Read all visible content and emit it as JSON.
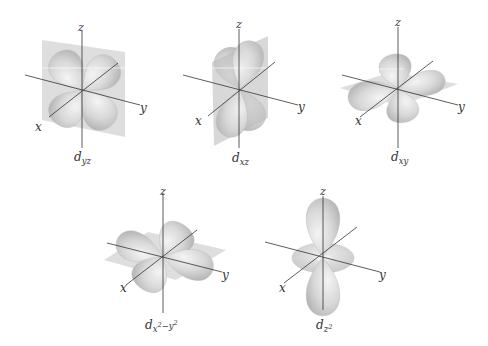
{
  "diagram": {
    "type": "d-orbital shapes",
    "colors": {
      "background": "#ffffff",
      "lobe_fill": "#d6d6d6",
      "lobe_highlight": "#f2f2f2",
      "lobe_shadow": "#b4b4b4",
      "plane_fill": "#bdbdbd",
      "axis_stroke": "#333333"
    },
    "axis_labels": {
      "x": "x",
      "y": "y",
      "z": "z"
    },
    "orbitals": [
      {
        "id": "dyz",
        "caption_main": "d",
        "caption_sub": "yz",
        "plane": "yz"
      },
      {
        "id": "dxz",
        "caption_main": "d",
        "caption_sub": "xz",
        "plane": "xz"
      },
      {
        "id": "dxy",
        "caption_main": "d",
        "caption_sub": "xy",
        "plane": "xy"
      },
      {
        "id": "dx2y2",
        "caption_main": "d",
        "caption_sub": "x",
        "caption_sup1": "2",
        "caption_mid": "−y",
        "caption_sup2": "2",
        "plane": "xy"
      },
      {
        "id": "dz2",
        "caption_main": "d",
        "caption_sub": "z",
        "caption_sup1": "2",
        "plane": "none"
      }
    ]
  }
}
